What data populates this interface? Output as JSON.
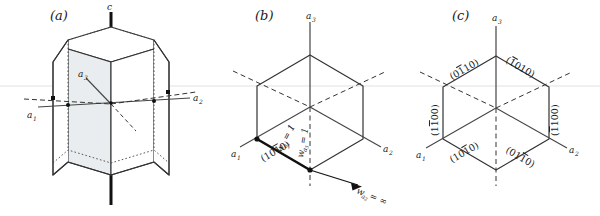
{
  "figure": {
    "background_color": "#ffffff",
    "line_color": "#1a1a1a",
    "face_fill": "#e8ecee",
    "faint_rule_color": "#d8dde0"
  },
  "panels": [
    {
      "id": "a",
      "letter": "(a)",
      "description": "hexagonal prism with c axis and a1, a2, a3 axes",
      "axes": [
        {
          "name": "c-axis",
          "label": "c",
          "subscript": ""
        },
        {
          "name": "a1-axis",
          "label": "a",
          "subscript": "1"
        },
        {
          "name": "a2-axis",
          "label": "a",
          "subscript": "2"
        },
        {
          "name": "a3-axis",
          "label": "a",
          "subscript": "3"
        }
      ]
    },
    {
      "id": "b",
      "letter": "(b)",
      "description": "hexagonal basal projection with one highlighted (10-10) face and Weiss parameters",
      "axes": [
        {
          "name": "a1-axis",
          "label": "a",
          "subscript": "1"
        },
        {
          "name": "a2-axis",
          "label": "a",
          "subscript": "2"
        },
        {
          "name": "a3-axis",
          "label": "a",
          "subscript": "3"
        }
      ],
      "plane_label": {
        "open": "(",
        "digits": "10",
        "barred": "1",
        "tail": "0",
        "close": ")"
      },
      "weiss": [
        {
          "name": "w-a1",
          "symbol": "w",
          "subscript": "a1",
          "value": "= 1"
        },
        {
          "name": "w-a3",
          "symbol": "w",
          "subscript": "a3",
          "value": "= 1"
        },
        {
          "name": "w-a2",
          "symbol": "w",
          "subscript": "a2",
          "value": "= ∞"
        }
      ]
    },
    {
      "id": "c",
      "letter": "(c)",
      "description": "hexagon with all six prism-face Miller-Bravais indices labelled",
      "axes": [
        {
          "name": "a1-axis",
          "label": "a",
          "subscript": "1"
        },
        {
          "name": "a2-axis",
          "label": "a",
          "subscript": "2"
        },
        {
          "name": "a3-axis",
          "label": "a",
          "subscript": "3"
        }
      ],
      "faces": [
        {
          "name": "face-top-left",
          "index": "(01̅1 0)",
          "pre": "(0",
          "bar": "1",
          "post": "10)"
        },
        {
          "name": "face-top-right",
          "index": "(̅1 010)",
          "pre": "(",
          "bar": "1",
          "post": "010)"
        },
        {
          "name": "face-left",
          "index": "(1̅1 00)",
          "pre": "(1",
          "bar": "1",
          "post": "00)"
        },
        {
          "name": "face-right",
          "index": "(̅1 100)",
          "pre": "(",
          "bar": "1",
          "post": "100)"
        },
        {
          "name": "face-bottom-left",
          "index": "(10̅1 0)",
          "pre": "(10",
          "bar": "1",
          "post": "0)"
        },
        {
          "name": "face-bottom-right",
          "index": "(01̅1 0)",
          "pre": "(01",
          "bar": "1",
          "post": "0)"
        }
      ]
    }
  ]
}
